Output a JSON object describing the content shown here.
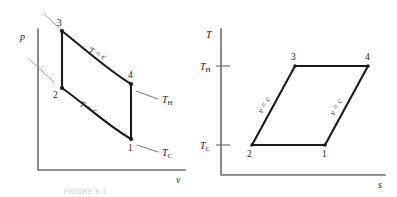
{
  "figure": {
    "caption": "FIGURE 9-1",
    "panels": [
      {
        "id": "pv-diagram",
        "name": "pressure-volume-diagram",
        "y_axis_label": "p",
        "x_axis_label": "v",
        "nodes": [
          {
            "label": "1",
            "x": 131,
            "y": 139
          },
          {
            "label": "2",
            "x": 62,
            "y": 88
          },
          {
            "label": "3",
            "x": 62,
            "y": 30
          },
          {
            "label": "4",
            "x": 131,
            "y": 83
          }
        ],
        "process_labels": [
          {
            "text": "T = c",
            "id": "isotherm-upper"
          },
          {
            "text": "T = c",
            "id": "isotherm-lower"
          }
        ],
        "temperature_labels": [
          {
            "base": "T",
            "sub": "H",
            "id": "t-hot"
          },
          {
            "base": "T",
            "sub": "C",
            "id": "t-cold"
          }
        ]
      },
      {
        "id": "ts-diagram",
        "name": "temperature-entropy-diagram",
        "y_axis_label": "T",
        "x_axis_label": "s",
        "nodes": [
          {
            "label": "1",
            "x": 325,
            "y": 145
          },
          {
            "label": "2",
            "x": 252,
            "y": 145
          },
          {
            "label": "3",
            "x": 295,
            "y": 66
          },
          {
            "label": "4",
            "x": 368,
            "y": 66
          }
        ],
        "process_labels": [
          {
            "text": "v = c",
            "id": "isochore-left"
          },
          {
            "text": "v = c",
            "id": "isochore-right"
          }
        ],
        "axis_ticks": [
          {
            "base": "T",
            "sub": "H",
            "id": "tick-t-hot",
            "y": 66
          },
          {
            "base": "T",
            "sub": "C",
            "id": "tick-t-cold",
            "y": 145
          }
        ]
      }
    ]
  },
  "colors": {
    "cycle_stroke": "#1b1b1d",
    "axis_stroke": "#6e6e70",
    "leader_stroke": "#7a7a7c",
    "background": "#ffffff"
  }
}
